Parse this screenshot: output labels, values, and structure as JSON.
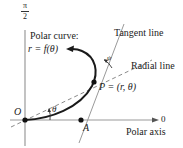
{
  "diagram": {
    "axis_top_label_num": "π",
    "axis_top_label_den": "2",
    "polar_axis_end_label": "0",
    "polar_axis_label": "Polar axis",
    "curve_label_line1": "Polar curve:",
    "curve_label_line2": "r = f(θ)",
    "tangent_label": "Tangent line",
    "radial_label": "Radial line",
    "point_label": "P = (r, θ)",
    "origin_label": "O",
    "point_a_label": "A",
    "angle_theta_label": "θ",
    "angle_psi_label": "ψ",
    "colors": {
      "axis": "#9a9a9a",
      "curve": "#1a1a1a",
      "dashed": "#8a8a8a",
      "text": "#222222"
    }
  }
}
